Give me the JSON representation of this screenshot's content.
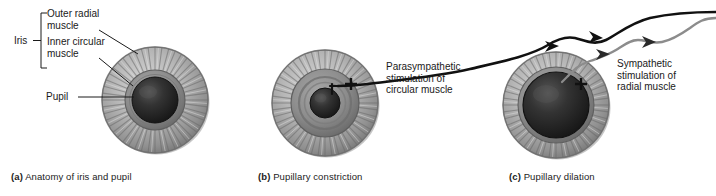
{
  "figure": {
    "background_color": "#ffffff",
    "ink_color": "#1a1a1a"
  },
  "colors": {
    "iris_outer_light": "#d2d2d2",
    "iris_outer_mid": "#9a9a9a",
    "iris_outer_dark": "#6f6f6f",
    "iris_rim": "#8a8a8a",
    "circular_muscle": "#8e8e8e",
    "circular_muscle_dark": "#6b6b6b",
    "pupil_dark": "#2b2b2b",
    "pupil_core": "#1c1c1c",
    "parasympathetic_nerve": "#111111",
    "sympathetic_nerve": "#8c8c8c",
    "leader_line": "#1a1a1a",
    "plus_sign": "#111111"
  },
  "panels": [
    {
      "id": "a",
      "caption_letter": "(a)",
      "caption_text": "Anatomy of iris and pupil",
      "labels": [
        {
          "name": "iris",
          "text": "Iris"
        },
        {
          "name": "outer-radial-muscle",
          "line1": "Outer radial",
          "line2": "muscle"
        },
        {
          "name": "inner-circular-muscle",
          "line1": "Inner circular",
          "line2": "muscle"
        },
        {
          "name": "pupil",
          "text": "Pupil"
        }
      ],
      "eye": {
        "pupil_state": "normal",
        "center_x": 155,
        "center_y": 100,
        "iris_radius": 53,
        "circular_muscle_radius": 30,
        "pupil_radius": 23
      }
    },
    {
      "id": "b",
      "caption_letter": "(b)",
      "caption_text": "Pupillary constriction",
      "callout": {
        "name": "parasympathetic-callout",
        "line1": "Parasympathetic",
        "line2": "stimulation of",
        "line3": "circular muscle"
      },
      "sign": "+",
      "nerve_type": "parasympathetic",
      "arrow_count": 2,
      "eye": {
        "pupil_state": "constricted",
        "center_x": 325,
        "center_y": 103,
        "iris_radius": 53,
        "circular_muscle_radius": 34,
        "pupil_radius": 15
      }
    },
    {
      "id": "c",
      "caption_letter": "(c)",
      "caption_text": "Pupillary dilation",
      "callout": {
        "name": "sympathetic-callout",
        "line1": "Sympathetic",
        "line2": "stimulation of",
        "line3": "radial muscle"
      },
      "sign": "+",
      "nerve_type": "sympathetic",
      "arrow_count": 2,
      "eye": {
        "pupil_state": "dilated",
        "center_x": 556,
        "center_y": 105,
        "iris_radius": 53,
        "circular_muscle_radius": 38,
        "pupil_radius": 33
      }
    }
  ]
}
